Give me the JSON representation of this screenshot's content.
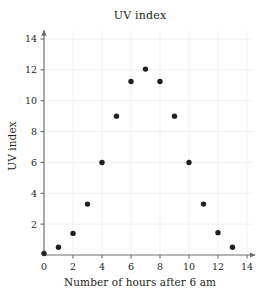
{
  "chart_data": {
    "type": "scatter",
    "title": "UV index",
    "xlabel": "Number of hours after 6 am",
    "ylabel": "UV index",
    "xlim": [
      0,
      14.6
    ],
    "ylim": [
      0,
      14.6
    ],
    "xticks": [
      0,
      2,
      4,
      6,
      8,
      10,
      12,
      14
    ],
    "xtick_labels": [
      "0",
      "2",
      "4",
      "6",
      "8",
      "10",
      "12",
      "14"
    ],
    "yticks": [
      2,
      4,
      6,
      8,
      10,
      12,
      14
    ],
    "ytick_labels": [
      "2",
      "4",
      "6",
      "8",
      "10",
      "12",
      "14"
    ],
    "origin_label": "0",
    "grid": true,
    "legend": "none",
    "marker": "filled-circle",
    "marker_color": "#231f20",
    "x": [
      0,
      1,
      2,
      3,
      4,
      5,
      6,
      7,
      8,
      9,
      10,
      11,
      12,
      13
    ],
    "y": [
      0.1,
      0.5,
      1.4,
      3.3,
      6.0,
      9.0,
      11.25,
      12.05,
      11.25,
      9.0,
      6.0,
      3.3,
      1.45,
      0.5
    ],
    "points": [
      {
        "x": 0,
        "y": 0.1
      },
      {
        "x": 1,
        "y": 0.5
      },
      {
        "x": 2,
        "y": 1.4
      },
      {
        "x": 3,
        "y": 3.3
      },
      {
        "x": 4,
        "y": 6.0
      },
      {
        "x": 5,
        "y": 9.0
      },
      {
        "x": 6,
        "y": 11.25
      },
      {
        "x": 7,
        "y": 12.05
      },
      {
        "x": 8,
        "y": 11.25
      },
      {
        "x": 9,
        "y": 9.0
      },
      {
        "x": 10,
        "y": 6.0
      },
      {
        "x": 11,
        "y": 3.3
      },
      {
        "x": 12,
        "y": 1.45
      },
      {
        "x": 13,
        "y": 0.5
      }
    ]
  },
  "colors": {
    "axis": "#6d6e71",
    "grid": "#f1f1f2",
    "marker": "#231f20",
    "text": "#231f20",
    "background": "#ffffff"
  }
}
